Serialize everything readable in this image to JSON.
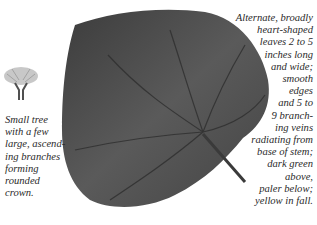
{
  "illustration": {
    "subject": "heart-shaped leaf",
    "leaf_color": "#4a4a4a",
    "tree_icon": "tree-silhouette-icon"
  },
  "captions": {
    "left": {
      "lines": [
        "Small tree",
        "with a few",
        "large, ascend-",
        "ing branches",
        "forming",
        "rounded",
        "crown."
      ]
    },
    "right": {
      "lines": [
        "Alternate, broadly",
        "heart-shaped",
        "leaves 2 to 5",
        "inches long",
        "and wide;",
        "smooth",
        "edges",
        "and 5 to",
        "9 branch-",
        "ing veins",
        "radiating from",
        "base of stem;",
        "dark green",
        "above,",
        "paler below;",
        "yellow in fall."
      ]
    }
  }
}
